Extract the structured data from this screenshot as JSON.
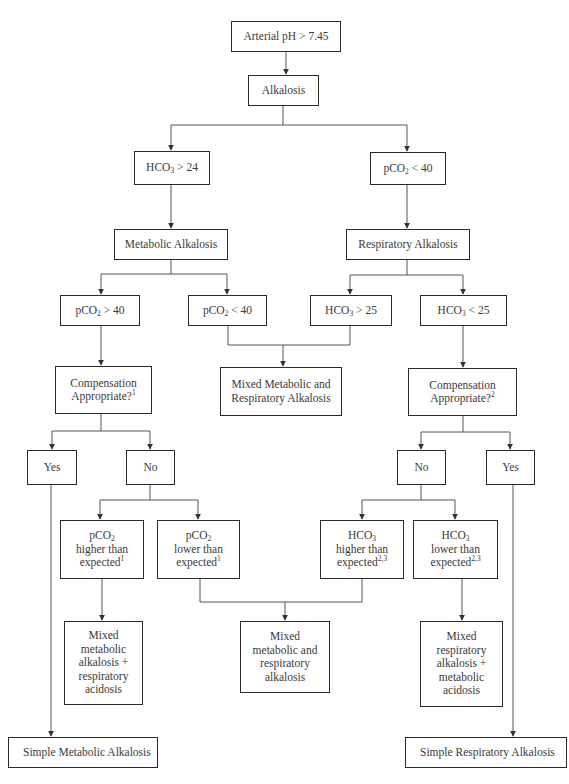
{
  "diagram": {
    "type": "flowchart",
    "colors": {
      "line": "#555555",
      "border": "#2a2a2a",
      "text": "#3a3a3a",
      "background": "#ffffff"
    },
    "nodes": {
      "start": {
        "lines": [
          "Arterial pH > 7.45"
        ]
      },
      "alkalosis": {
        "lines": [
          "Alkalosis"
        ]
      },
      "hco3_gt_24": {
        "pre": "HCO",
        "sub": "3",
        "post": " > 24"
      },
      "pco2_lt_40_top": {
        "pre": "pCO",
        "sub": "2",
        "post": " < 40"
      },
      "metabolic": {
        "lines": [
          "Metabolic Alkalosis"
        ]
      },
      "respiratory": {
        "lines": [
          "Respiratory Alkalosis"
        ]
      },
      "pco2_gt_40": {
        "pre": "pCO",
        "sub": "2",
        "post": " > 40"
      },
      "pco2_lt_40": {
        "pre": "pCO",
        "sub": "2",
        "post": " < 40"
      },
      "hco3_gt_25": {
        "pre": "HCO",
        "sub": "3",
        "post": " > 25"
      },
      "hco3_lt_25": {
        "pre": "HCO",
        "sub": "3",
        "post": " < 25"
      },
      "mixed_met_resp_alk": {
        "lines": [
          "Mixed Metabolic and",
          "Respiratory Alkalosis"
        ]
      },
      "comp_left": {
        "line1": "Compensation",
        "line2": "Appropriate?",
        "sup": "1"
      },
      "comp_right": {
        "line1": "Compensation",
        "line2": "Appropriate?",
        "sup": "2"
      },
      "yes_left": {
        "lines": [
          "Yes"
        ]
      },
      "no_left": {
        "lines": [
          "No"
        ]
      },
      "no_right": {
        "lines": [
          "No"
        ]
      },
      "yes_right": {
        "lines": [
          "Yes"
        ]
      },
      "pco2_higher": {
        "pre": "pCO",
        "sub": "2",
        "line2": "higher than",
        "line3": "expected",
        "sup": "1"
      },
      "pco2_lower": {
        "pre": "pCO",
        "sub": "2",
        "line2": "lower than",
        "line3": "expected",
        "sup": "1"
      },
      "hco3_higher": {
        "pre": "HCO",
        "sub": "3",
        "line2": "higher than",
        "line3": "expected",
        "sup": "2,3"
      },
      "hco3_lower": {
        "pre": "HCO",
        "sub": "3",
        "line2": "lower than",
        "line3": "expected",
        "sup": "2,3"
      },
      "mixed_met_alk_resp_acid": {
        "lines": [
          "Mixed",
          "metabolic",
          "alkalosis +",
          "respiratory",
          "acidosis"
        ]
      },
      "mixed_met_resp_alk_2": {
        "lines": [
          "Mixed",
          "metabolic and",
          "respiratory",
          "alkalosis"
        ]
      },
      "mixed_resp_alk_met_acid": {
        "lines": [
          "Mixed",
          "respiratory",
          "alkalosis +",
          "metabolic",
          "acidosis"
        ]
      },
      "simple_metabolic": {
        "lines": [
          "Simple Metabolic Alkalosis"
        ]
      },
      "simple_respiratory": {
        "lines": [
          "Simple Respiratory Alkalosis"
        ]
      }
    },
    "edges": [
      [
        "start",
        "alkalosis"
      ],
      [
        "alkalosis",
        "hco3_gt_24"
      ],
      [
        "alkalosis",
        "pco2_lt_40_top"
      ],
      [
        "hco3_gt_24",
        "metabolic"
      ],
      [
        "pco2_lt_40_top",
        "respiratory"
      ],
      [
        "metabolic",
        "pco2_gt_40"
      ],
      [
        "metabolic",
        "pco2_lt_40"
      ],
      [
        "respiratory",
        "hco3_gt_25"
      ],
      [
        "respiratory",
        "hco3_lt_25"
      ],
      [
        "pco2_lt_40",
        "mixed_met_resp_alk"
      ],
      [
        "hco3_gt_25",
        "mixed_met_resp_alk"
      ],
      [
        "pco2_gt_40",
        "comp_left"
      ],
      [
        "hco3_lt_25",
        "comp_right"
      ],
      [
        "comp_left",
        "yes_left"
      ],
      [
        "comp_left",
        "no_left"
      ],
      [
        "comp_right",
        "no_right"
      ],
      [
        "comp_right",
        "yes_right"
      ],
      [
        "no_left",
        "pco2_higher"
      ],
      [
        "no_left",
        "pco2_lower"
      ],
      [
        "no_right",
        "hco3_higher"
      ],
      [
        "no_right",
        "hco3_lower"
      ],
      [
        "pco2_higher",
        "mixed_met_alk_resp_acid"
      ],
      [
        "pco2_lower",
        "mixed_met_resp_alk_2"
      ],
      [
        "hco3_higher",
        "mixed_met_resp_alk_2"
      ],
      [
        "hco3_lower",
        "mixed_resp_alk_met_acid"
      ],
      [
        "yes_left",
        "simple_metabolic"
      ],
      [
        "yes_right",
        "simple_respiratory"
      ]
    ]
  }
}
